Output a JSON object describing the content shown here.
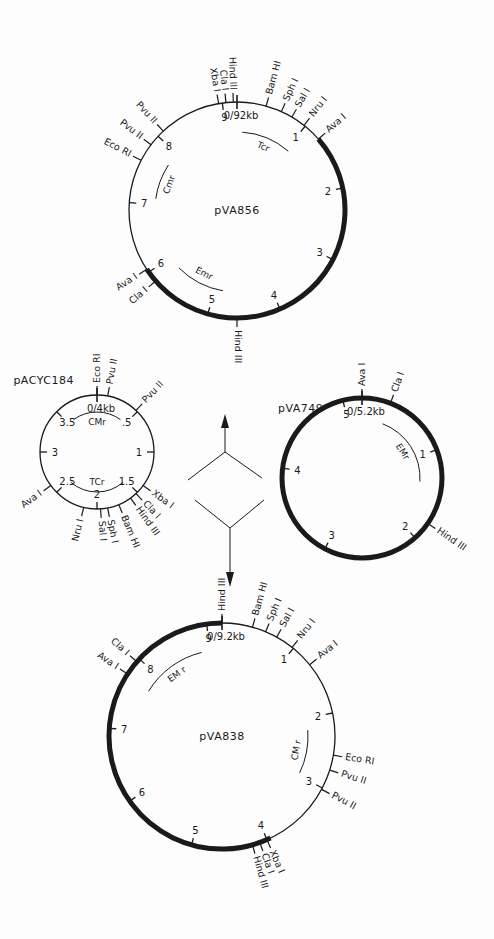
{
  "figure": {
    "type": "plasmid construction diagram",
    "colors": {
      "ink": "#1a1a1a",
      "background": "#fdfdfd"
    }
  },
  "plasmids": [
    {
      "id": "pVA856",
      "name": "pVA856",
      "size_label": "0/92kb",
      "size_kb": 9.2,
      "center": [
        237,
        210
      ],
      "radius": 108,
      "ticks": [
        {
          "label": "1",
          "kb": 1
        },
        {
          "label": "2",
          "kb": 2
        },
        {
          "label": "3",
          "kb": 3
        },
        {
          "label": "4",
          "kb": 4
        },
        {
          "label": "5",
          "kb": 5
        },
        {
          "label": "6",
          "kb": 6
        },
        {
          "label": "7",
          "kb": 7
        },
        {
          "label": "8",
          "kb": 8
        },
        {
          "label": "9",
          "kb": 9
        }
      ],
      "thick_segment_kb": [
        1.25,
        6.05
      ],
      "sites": [
        {
          "label": "Hind III",
          "kb": 9.15
        },
        {
          "label": "Cla I",
          "kb": 9.05
        },
        {
          "label": "Xba I",
          "kb": 8.95
        },
        {
          "label": "Bam HI",
          "kb": 0.4
        },
        {
          "label": "Sph I",
          "kb": 0.62
        },
        {
          "label": "Sal I",
          "kb": 0.78
        },
        {
          "label": "Nru I",
          "kb": 0.98
        },
        {
          "label": "Ava I",
          "kb": 1.25
        },
        {
          "label": "Pvu II",
          "kb": 8.1
        },
        {
          "label": "Pvu II",
          "kb": 7.85
        },
        {
          "label": "Eco RI",
          "kb": 7.6
        },
        {
          "label": "Ava I",
          "kb": 6.05
        },
        {
          "label": "Cla I",
          "kb": 5.85
        },
        {
          "label": "Hind III",
          "kb": 4.6
        }
      ],
      "resistance": [
        {
          "label": "Tcr",
          "start_kb": 0.1,
          "end_kb": 1.05,
          "r": 78
        },
        {
          "label": "Cmr",
          "start_kb": 7.1,
          "end_kb": 7.75,
          "r": 82
        },
        {
          "label": "Emr",
          "start_kb": 4.85,
          "end_kb": 5.75,
          "r": 82
        }
      ]
    },
    {
      "id": "pACYC184",
      "name": "pACYC184",
      "size_label": "0/4kb",
      "size_kb": 4.0,
      "center": [
        97,
        452
      ],
      "radius": 57,
      "ticks": [
        {
          "label": ".5",
          "kb": 0.5
        },
        {
          "label": "1",
          "kb": 1
        },
        {
          "label": "1.5",
          "kb": 1.5
        },
        {
          "label": "2",
          "kb": 2
        },
        {
          "label": "2.5",
          "kb": 2.5
        },
        {
          "label": "3",
          "kb": 3
        },
        {
          "label": "3.5",
          "kb": 3.5
        }
      ],
      "sites": [
        {
          "label": "Eco RI",
          "kb": 0.0
        },
        {
          "label": "Pvu II",
          "kb": 0.12
        },
        {
          "label": "Pvu II",
          "kb": 0.48
        },
        {
          "label": "Xba I",
          "kb": 1.4
        },
        {
          "label": "Cla I",
          "kb": 1.52
        },
        {
          "label": "Hind III",
          "kb": 1.6
        },
        {
          "label": "Bam HI",
          "kb": 1.75
        },
        {
          "label": "Sph I",
          "kb": 1.88
        },
        {
          "label": "Sal I",
          "kb": 1.96
        },
        {
          "label": "Nru I",
          "kb": 2.15
        },
        {
          "label": "Ava I",
          "kb": 2.6
        }
      ],
      "resistance": [
        {
          "label": "CMr",
          "start_kb": 3.6,
          "end_kb": 0.4,
          "r": 40
        },
        {
          "label": "TCr",
          "start_kb": 1.55,
          "end_kb": 2.45,
          "r": 40
        }
      ]
    },
    {
      "id": "pVA749",
      "name": "pVA749",
      "size_label": "0/5.2kb",
      "size_kb": 5.2,
      "center": [
        362,
        478
      ],
      "radius": 80,
      "ticks": [
        {
          "label": "1",
          "kb": 1
        },
        {
          "label": "2",
          "kb": 2
        },
        {
          "label": "3",
          "kb": 3
        },
        {
          "label": "4",
          "kb": 4
        },
        {
          "label": "5",
          "kb": 5
        }
      ],
      "thick_segment_kb": [
        0,
        5.2
      ],
      "sites": [
        {
          "label": "Ava I",
          "kb": 0.0
        },
        {
          "label": "Cla I",
          "kb": 0.3
        },
        {
          "label": "Hind III",
          "kb": 1.8
        }
      ],
      "resistance": [
        {
          "label": "EMr",
          "start_kb": 0.3,
          "end_kb": 1.35,
          "r": 58
        }
      ]
    },
    {
      "id": "pVA838",
      "name": "pVA838",
      "size_label": "0/9.2kb",
      "size_kb": 9.2,
      "center": [
        222,
        736
      ],
      "radius": 113,
      "ticks": [
        {
          "label": "1",
          "kb": 1
        },
        {
          "label": "2",
          "kb": 2
        },
        {
          "label": "3",
          "kb": 3
        },
        {
          "label": "4",
          "kb": 4
        },
        {
          "label": "5",
          "kb": 5
        },
        {
          "label": "6",
          "kb": 6
        },
        {
          "label": "7",
          "kb": 7
        },
        {
          "label": "8",
          "kb": 8
        },
        {
          "label": "9",
          "kb": 9
        }
      ],
      "thick_segment_kb": [
        3.95,
        9.2
      ],
      "sites": [
        {
          "label": "Hind III",
          "kb": 0.0
        },
        {
          "label": "Bam HI",
          "kb": 0.4
        },
        {
          "label": "Sph I",
          "kb": 0.58
        },
        {
          "label": "Sal I",
          "kb": 0.74
        },
        {
          "label": "Nru I",
          "kb": 0.98
        },
        {
          "label": "Ava I",
          "kb": 1.3
        },
        {
          "label": "Eco RI",
          "kb": 2.55
        },
        {
          "label": "Pvu II",
          "kb": 2.75
        },
        {
          "label": "Pvu II",
          "kb": 3.02
        },
        {
          "label": "Xba I",
          "kb": 4.0
        },
        {
          "label": "Cla I",
          "kb": 4.1
        },
        {
          "label": "Hind III",
          "kb": 4.2
        },
        {
          "label": "Cla I",
          "kb": 7.95
        },
        {
          "label": "Ava I",
          "kb": 7.75
        }
      ],
      "resistance": [
        {
          "label": "EM r",
          "start_kb": 7.7,
          "end_kb": 8.85,
          "r": 86
        },
        {
          "label": "CM r",
          "start_kb": 2.2,
          "end_kb": 2.95,
          "r": 86
        }
      ]
    }
  ],
  "arrows": [
    {
      "label": "Hind III",
      "direction": "up",
      "from": [
        222,
        410
      ],
      "to": [
        222,
        366
      ]
    },
    {
      "label": "Hind III",
      "direction": "down",
      "from": [
        229,
        532
      ],
      "to": [
        229,
        588
      ]
    }
  ]
}
